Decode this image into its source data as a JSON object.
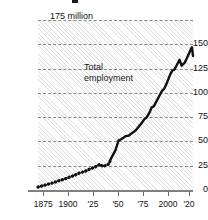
{
  "chart_data": {
    "type": "line",
    "title": "",
    "xlabel": "",
    "ylabel": "",
    "unit_note": "175 million",
    "series_annotation": "Total\nemployment",
    "annotation_line1": "Total",
    "annotation_line2": "employment",
    "grid": true,
    "grid_style": "dashed-horizontal",
    "legend_position": "inline-annotation",
    "xlim": [
      1870,
      2020
    ],
    "ylim": [
      0,
      175
    ],
    "y_ticks": [
      0,
      25,
      50,
      75,
      100,
      125,
      150,
      175
    ],
    "y_tick_labels": [
      "0",
      "25",
      "50",
      "75",
      "100",
      "125",
      "150",
      "175 million"
    ],
    "x_ticks": [
      1875,
      1900,
      1925,
      1950,
      1975,
      2000,
      2020
    ],
    "x_tick_labels": [
      "1875",
      "1900",
      "'25",
      "'50",
      "'75",
      "2000",
      "'20"
    ],
    "series": [
      {
        "name": "Total employment",
        "style_early": "dotted",
        "style_late": "solid",
        "style_break_year": 1940,
        "x": [
          1870,
          1875,
          1880,
          1885,
          1890,
          1895,
          1900,
          1905,
          1910,
          1915,
          1920,
          1925,
          1930,
          1933,
          1936,
          1939,
          1940,
          1945,
          1948,
          1950,
          1953,
          1955,
          1958,
          1960,
          1963,
          1965,
          1968,
          1970,
          1973,
          1975,
          1978,
          1980,
          1982,
          1985,
          1988,
          1990,
          1992,
          1995,
          1998,
          2000,
          2002,
          2005,
          2007,
          2009,
          2012,
          2015,
          2018,
          2019,
          2020
        ],
        "values": [
          3.0,
          4.5,
          6.0,
          7.5,
          9.5,
          11.0,
          13.0,
          15.0,
          17.5,
          19.0,
          21.5,
          23.5,
          26.5,
          24.0,
          25.5,
          27.0,
          31.0,
          41.0,
          51.0,
          52.0,
          54.0,
          55.5,
          56.0,
          58.0,
          60.0,
          62.0,
          66.0,
          68.5,
          73.0,
          74.5,
          80.0,
          85.0,
          86.0,
          92.0,
          98.0,
          102.0,
          104.0,
          111.0,
          119.0,
          123.0,
          124.0,
          130.0,
          134.0,
          128.0,
          131.0,
          138.0,
          145.0,
          147.0,
          138.0
        ]
      }
    ]
  },
  "chart": {
    "unit_label": "175 million",
    "y_labels": [
      "150",
      "125",
      "100",
      "75",
      "50",
      "25",
      "0"
    ],
    "x_labels": [
      "1875",
      "1900",
      "'25",
      "'50",
      "'75",
      "2000",
      "'20"
    ],
    "annotation_line1": "Total",
    "annotation_line2": "employment",
    "colors": {
      "series": "#111111",
      "axis": "#808080",
      "grid": "#8a8a8a",
      "text": "#111111",
      "plot_background": "#fcfcfc"
    }
  }
}
